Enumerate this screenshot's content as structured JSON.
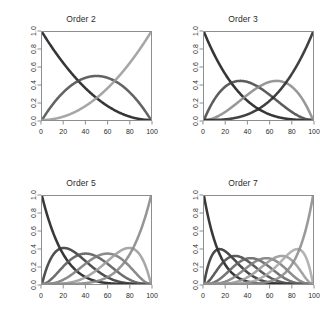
{
  "figure": {
    "background": "#ffffff",
    "frame_color": "#8e8e8e",
    "text_color": "#2b2b2b",
    "layout": "2x2 grid of panels"
  },
  "chart_data": [
    {
      "type": "line",
      "title": "Order 2",
      "xlabel": "",
      "ylabel": "",
      "xlim": [
        0,
        100
      ],
      "ylim": [
        0,
        1.0
      ],
      "xticks": [
        0,
        20,
        40,
        60,
        80,
        100
      ],
      "yticks": [
        "0.0",
        "0.2",
        "0.4",
        "0.6",
        "0.8",
        "1.0"
      ],
      "grid": false,
      "legend": "none",
      "description": "Bernstein polynomial basis of degree 2 on x in [0,100]",
      "series": [
        {
          "name": "B0",
          "color": "#1a1a1a",
          "k": 0,
          "n": 2
        },
        {
          "name": "B1",
          "color": "#4d4d4d",
          "k": 1,
          "n": 2
        },
        {
          "name": "B2",
          "color": "#9a9a9a",
          "k": 2,
          "n": 2
        }
      ]
    },
    {
      "type": "line",
      "title": "Order 3",
      "xlabel": "",
      "ylabel": "",
      "xlim": [
        0,
        100
      ],
      "ylim": [
        0,
        1.0
      ],
      "xticks": [
        0,
        20,
        40,
        60,
        80,
        100
      ],
      "yticks": [
        "0.0",
        "0.2",
        "0.4",
        "0.6",
        "0.8",
        "1.0"
      ],
      "grid": false,
      "legend": "none",
      "description": "Bernstein polynomial basis of degree 3 on x in [0,100]",
      "series": [
        {
          "name": "B0",
          "color": "#1a1a1a",
          "k": 0,
          "n": 3
        },
        {
          "name": "B1",
          "color": "#454545",
          "k": 1,
          "n": 3
        },
        {
          "name": "B2",
          "color": "#8a8a8a",
          "k": 2,
          "n": 3
        },
        {
          "name": "B3",
          "color": "#272727",
          "k": 3,
          "n": 3
        }
      ]
    },
    {
      "type": "line",
      "title": "Order 5",
      "xlabel": "",
      "ylabel": "",
      "xlim": [
        0,
        100
      ],
      "ylim": [
        0,
        1.0
      ],
      "xticks": [
        0,
        20,
        40,
        60,
        80,
        100
      ],
      "yticks": [
        "0.0",
        "0.2",
        "0.4",
        "0.6",
        "0.8",
        "1.0"
      ],
      "grid": false,
      "legend": "none",
      "description": "Bernstein polynomial basis of degree 5 on x in [0,100]",
      "series": [
        {
          "name": "B0",
          "color": "#1c1c1c",
          "k": 0,
          "n": 5
        },
        {
          "name": "B1",
          "color": "#383838",
          "k": 1,
          "n": 5
        },
        {
          "name": "B2",
          "color": "#595959",
          "k": 2,
          "n": 5
        },
        {
          "name": "B3",
          "color": "#7b7b7b",
          "k": 3,
          "n": 5
        },
        {
          "name": "B4",
          "color": "#9c9c9c",
          "k": 4,
          "n": 5
        },
        {
          "name": "B5",
          "color": "#888888",
          "k": 5,
          "n": 5
        }
      ]
    },
    {
      "type": "line",
      "title": "Order 7",
      "xlabel": "",
      "ylabel": "",
      "xlim": [
        0,
        100
      ],
      "ylim": [
        0,
        1.0
      ],
      "xticks": [
        0,
        20,
        40,
        60,
        80,
        100
      ],
      "yticks": [
        "0.0",
        "0.2",
        "0.4",
        "0.6",
        "0.8",
        "1.0"
      ],
      "grid": false,
      "legend": "none",
      "description": "Bernstein polynomial basis of degree 7 on x in [0,100]",
      "series": [
        {
          "name": "B0",
          "color": "#1c1c1c",
          "k": 0,
          "n": 7
        },
        {
          "name": "B1",
          "color": "#303030",
          "k": 1,
          "n": 7
        },
        {
          "name": "B2",
          "color": "#474747",
          "k": 2,
          "n": 7
        },
        {
          "name": "B3",
          "color": "#626262",
          "k": 3,
          "n": 7
        },
        {
          "name": "B4",
          "color": "#7d7d7d",
          "k": 4,
          "n": 7
        },
        {
          "name": "B5",
          "color": "#989898",
          "k": 5,
          "n": 7
        },
        {
          "name": "B6",
          "color": "#a8a8a8",
          "k": 6,
          "n": 7
        },
        {
          "name": "B7",
          "color": "#8c8c8c",
          "k": 7,
          "n": 7
        }
      ]
    }
  ],
  "panels": [
    {
      "title": "Order 2",
      "left": 0,
      "top": 0
    },
    {
      "title": "Order 3",
      "left": 162,
      "top": 0
    },
    {
      "title": "Order 5",
      "left": 0,
      "top": 164
    },
    {
      "title": "Order 7",
      "left": 162,
      "top": 164
    }
  ]
}
